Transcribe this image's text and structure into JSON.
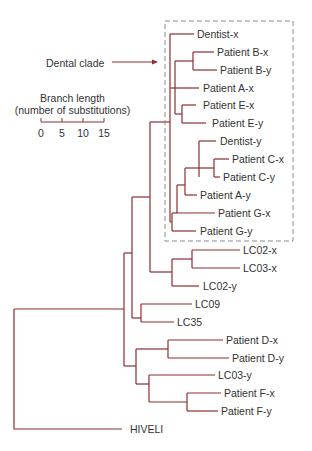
{
  "colors": {
    "branch": "#8b2e2e",
    "box": "#8a8a8a",
    "arrow": "#8b2e2e",
    "text": "#333333"
  },
  "annotation": {
    "label": "Dental clade",
    "x": 46,
    "y": 57,
    "arrow": {
      "x1": 112,
      "y1": 62,
      "x2": 158,
      "y2": 62
    }
  },
  "clade_box": {
    "x": 165,
    "y": 21,
    "w": 128,
    "h": 220
  },
  "scale_bar": {
    "title_line1": "Branch length",
    "title_line2": "(number of substitutions)",
    "ticks": [
      {
        "label": "0",
        "x": 41
      },
      {
        "label": "5",
        "x": 62
      },
      {
        "label": "10",
        "x": 83
      },
      {
        "label": "15",
        "x": 104
      }
    ],
    "y": 122
  },
  "leaves": [
    {
      "label": "Dentist-x",
      "x": 197,
      "y": 34
    },
    {
      "label": "Patient B-x",
      "x": 217,
      "y": 52
    },
    {
      "label": "Patient B-y",
      "x": 220,
      "y": 70
    },
    {
      "label": "Patient A-x",
      "x": 203,
      "y": 88
    },
    {
      "label": "Patient E-x",
      "x": 203,
      "y": 105
    },
    {
      "label": "Patient E-y",
      "x": 212,
      "y": 123
    },
    {
      "label": "Dentist-y",
      "x": 220,
      "y": 141
    },
    {
      "label": "Patient C-x",
      "x": 232,
      "y": 159
    },
    {
      "label": "Patient C-y",
      "x": 223,
      "y": 177
    },
    {
      "label": "Patient A-y",
      "x": 200,
      "y": 195
    },
    {
      "label": "Patient G-x",
      "x": 218,
      "y": 213
    },
    {
      "label": "Patient G-y",
      "x": 200,
      "y": 231
    },
    {
      "label": "LC02-x",
      "x": 243,
      "y": 250
    },
    {
      "label": "LC03-x",
      "x": 243,
      "y": 268
    },
    {
      "label": "LC02-y",
      "x": 203,
      "y": 286
    },
    {
      "label": "LC09",
      "x": 195,
      "y": 304
    },
    {
      "label": "LC35",
      "x": 177,
      "y": 322
    },
    {
      "label": "Patient D-x",
      "x": 226,
      "y": 340
    },
    {
      "label": "Patient D-y",
      "x": 232,
      "y": 358
    },
    {
      "label": "LC03-y",
      "x": 218,
      "y": 375
    },
    {
      "label": "Patient F-x",
      "x": 224,
      "y": 393
    },
    {
      "label": "Patient F-y",
      "x": 221,
      "y": 411
    },
    {
      "label": "HIVELI",
      "x": 130,
      "y": 429
    }
  ],
  "branches": [
    "M14 309 V429 H122",
    "M14 309 H124",
    "M124 253 V366",
    "M124 253 H132",
    "M132 197 V318",
    "M132 197 H150",
    "M150 122 V272",
    "M150 122 H170",
    "M170 34 V123",
    "M170 34 H194",
    "M170 88 H199",
    "M175 61 V114",
    "M175 61 H193",
    "M193 52 V70",
    "M193 52 H214",
    "M193 70 H217",
    "M175 114 H182",
    "M182 105 V123",
    "M182 105 H196",
    "M182 123 H206",
    "M170 123 V222",
    "M170 222 H172",
    "M172 213 V231",
    "M172 231 H196",
    "M172 213 H177",
    "M177 185 V213",
    "M177 213 H215",
    "M177 185 H185",
    "M185 168 V195",
    "M185 195 H197",
    "M185 168 H199",
    "M199 141 V177",
    "M199 141 H216",
    "M199 168 H214",
    "M214 159 V177",
    "M214 159 H229",
    "M214 177 H220",
    "M150 272 H172",
    "M172 259 V286",
    "M172 286 H199",
    "M172 259 H192",
    "M192 250 V268",
    "M192 250 H240",
    "M192 268 H240",
    "M132 318 H141",
    "M141 304 V322",
    "M141 304 H192",
    "M141 322 H174",
    "M124 366 H136",
    "M136 349 V384",
    "M136 349 H168",
    "M168 340 V358",
    "M168 340 H223",
    "M168 358 H229",
    "M136 384 H149",
    "M149 375 V402",
    "M149 375 H215",
    "M149 402 H187",
    "M187 393 V411",
    "M187 393 H221",
    "M187 411 H218"
  ]
}
